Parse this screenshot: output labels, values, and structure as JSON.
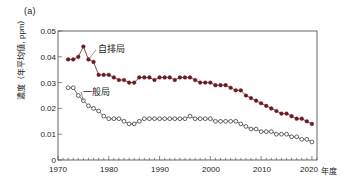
{
  "panel": {
    "label": "(a)"
  },
  "axes": {
    "ylabel": "濃度（年平均値, ppm）",
    "xunit": "年度",
    "yticks": [
      "0.05",
      "0.04",
      "0.03",
      "0.02",
      "0.01",
      "0"
    ],
    "xticks": [
      "1970",
      "1980",
      "1990",
      "2000",
      "2010",
      "2020"
    ]
  },
  "series_labels": {
    "roadside": "自排局",
    "general": "一般局"
  },
  "colors": {
    "roadside": "#6b1a20",
    "general": "#333333",
    "axis": "#555555",
    "text": "#1a1a1a"
  },
  "chart_data": {
    "type": "line",
    "title": "",
    "subtitle": "",
    "xlabel": "年度",
    "ylabel": "濃度（年平均値, ppm）",
    "xlim": [
      1970,
      2021
    ],
    "ylim": [
      0,
      0.05
    ],
    "ytick_values": [
      0.05,
      0.04,
      0.03,
      0.02,
      0.01,
      0
    ],
    "xtick_values": [
      1970,
      1980,
      1990,
      2000,
      2010,
      2020
    ],
    "grid": false,
    "legend_position": "inline-annotation",
    "minor_xticks": "every 1 year",
    "series": [
      {
        "name": "自排局",
        "marker": "filled-circle",
        "color": "#6b1a20",
        "x": [
          1972,
          1973,
          1974,
          1975,
          1976,
          1977,
          1978,
          1979,
          1980,
          1981,
          1982,
          1983,
          1984,
          1985,
          1986,
          1987,
          1988,
          1989,
          1990,
          1991,
          1992,
          1993,
          1994,
          1995,
          1996,
          1997,
          1998,
          1999,
          2000,
          2001,
          2002,
          2003,
          2004,
          2005,
          2006,
          2007,
          2008,
          2009,
          2010,
          2011,
          2012,
          2013,
          2014,
          2015,
          2016,
          2017,
          2018,
          2019,
          2020
        ],
        "values": [
          0.039,
          0.039,
          0.04,
          0.044,
          0.039,
          0.038,
          0.033,
          0.033,
          0.033,
          0.032,
          0.031,
          0.031,
          0.03,
          0.03,
          0.032,
          0.032,
          0.032,
          0.031,
          0.032,
          0.032,
          0.032,
          0.031,
          0.032,
          0.032,
          0.032,
          0.031,
          0.03,
          0.03,
          0.03,
          0.029,
          0.029,
          0.029,
          0.028,
          0.027,
          0.027,
          0.025,
          0.024,
          0.023,
          0.022,
          0.021,
          0.02,
          0.019,
          0.018,
          0.018,
          0.017,
          0.016,
          0.016,
          0.015,
          0.014
        ]
      },
      {
        "name": "一般局",
        "marker": "open-circle",
        "color": "#333333",
        "x": [
          1972,
          1973,
          1974,
          1975,
          1976,
          1977,
          1978,
          1979,
          1980,
          1981,
          1982,
          1983,
          1984,
          1985,
          1986,
          1987,
          1988,
          1989,
          1990,
          1991,
          1992,
          1993,
          1994,
          1995,
          1996,
          1997,
          1998,
          1999,
          2000,
          2001,
          2002,
          2003,
          2004,
          2005,
          2006,
          2007,
          2008,
          2009,
          2010,
          2011,
          2012,
          2013,
          2014,
          2015,
          2016,
          2017,
          2018,
          2019,
          2020
        ],
        "values": [
          0.028,
          0.028,
          0.025,
          0.023,
          0.021,
          0.02,
          0.019,
          0.017,
          0.016,
          0.016,
          0.016,
          0.015,
          0.014,
          0.014,
          0.015,
          0.016,
          0.016,
          0.016,
          0.016,
          0.016,
          0.016,
          0.016,
          0.016,
          0.016,
          0.017,
          0.016,
          0.016,
          0.016,
          0.016,
          0.015,
          0.015,
          0.015,
          0.015,
          0.015,
          0.014,
          0.013,
          0.012,
          0.012,
          0.011,
          0.011,
          0.011,
          0.01,
          0.01,
          0.01,
          0.009,
          0.009,
          0.008,
          0.008,
          0.007
        ]
      }
    ]
  }
}
